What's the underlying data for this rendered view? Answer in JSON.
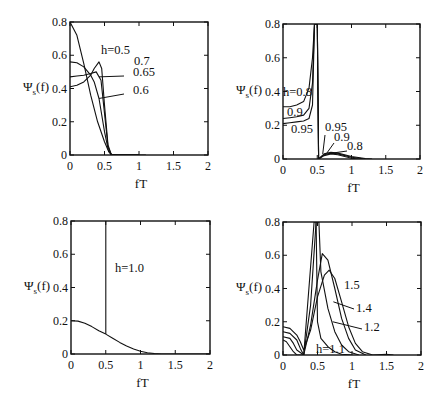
{
  "chart_data": [
    {
      "type": "line",
      "panel": "top-left",
      "title": "",
      "xlabel": "fT",
      "ylabel": "Ψs(f)",
      "xlim": [
        0,
        2
      ],
      "ylim": [
        0,
        0.8
      ],
      "xticks": [
        "0",
        "0.5",
        "1",
        "1.5",
        "2"
      ],
      "yticks": [
        "0",
        "0.2",
        "0.4",
        "0.6",
        "0.8"
      ],
      "grid": false,
      "legend": "inline annotations",
      "series": [
        {
          "name": "h=0.5",
          "x": [
            0,
            0.1,
            0.2,
            0.3,
            0.4,
            0.5,
            0.55,
            0.6,
            0.7,
            1.0
          ],
          "values": [
            0.8,
            0.72,
            0.55,
            0.36,
            0.2,
            0.08,
            0.03,
            0.005,
            0.0,
            0.0
          ]
        },
        {
          "name": "0.7",
          "x": [
            0,
            0.1,
            0.2,
            0.3,
            0.35,
            0.42,
            0.46,
            0.5,
            0.55,
            0.6,
            1.1
          ],
          "values": [
            0.41,
            0.42,
            0.44,
            0.48,
            0.52,
            0.56,
            0.52,
            0.3,
            0.06,
            0.0,
            0.0
          ]
        },
        {
          "name": "0.65",
          "x": [
            0,
            0.1,
            0.2,
            0.3,
            0.38,
            0.45,
            0.5,
            0.55,
            0.6,
            1.0
          ],
          "values": [
            0.47,
            0.475,
            0.48,
            0.49,
            0.5,
            0.45,
            0.25,
            0.05,
            0.0,
            0.0
          ]
        },
        {
          "name": "0.6",
          "x": [
            0,
            0.1,
            0.2,
            0.3,
            0.35,
            0.42,
            0.5,
            0.56,
            0.6,
            1.0
          ],
          "values": [
            0.56,
            0.555,
            0.53,
            0.48,
            0.44,
            0.34,
            0.14,
            0.02,
            0.0,
            0.0
          ]
        }
      ],
      "annotations": [
        "h=0.5",
        "0.7",
        "0.65",
        "0.6"
      ]
    },
    {
      "type": "line",
      "panel": "top-right",
      "title": "",
      "xlabel": "fT",
      "ylabel": "Ψs(f)",
      "xlim": [
        0,
        2
      ],
      "ylim": [
        0,
        0.8
      ],
      "xticks": [
        "0",
        "0.5",
        "1",
        "1.5",
        "2"
      ],
      "yticks": [
        "0",
        "0.2",
        "0.4",
        "0.6",
        "0.8"
      ],
      "grid": false,
      "legend": "inline annotations",
      "series": [
        {
          "name": "h=0.8",
          "x": [
            0,
            0.1,
            0.2,
            0.3,
            0.38,
            0.43,
            0.46,
            0.48,
            0.5,
            0.52,
            0.6,
            0.7,
            0.8,
            1.0,
            1.2,
            1.3
          ],
          "values": [
            0.31,
            0.31,
            0.32,
            0.34,
            0.42,
            0.6,
            0.8,
            0.8,
            0.8,
            0.0,
            0.03,
            0.04,
            0.035,
            0.015,
            0.003,
            0.0
          ]
        },
        {
          "name": "0.9",
          "x": [
            0,
            0.1,
            0.2,
            0.3,
            0.38,
            0.43,
            0.46,
            0.48,
            0.5,
            0.52,
            0.6,
            0.7,
            0.8,
            1.0,
            1.2
          ],
          "values": [
            0.24,
            0.245,
            0.25,
            0.26,
            0.3,
            0.45,
            0.8,
            0.8,
            0.8,
            0.0,
            0.025,
            0.035,
            0.03,
            0.01,
            0.0
          ]
        },
        {
          "name": "0.95",
          "x": [
            0,
            0.1,
            0.2,
            0.3,
            0.38,
            0.43,
            0.46,
            0.48,
            0.5,
            0.52,
            0.6,
            0.7,
            0.8,
            1.0,
            1.1
          ],
          "values": [
            0.21,
            0.215,
            0.22,
            0.225,
            0.24,
            0.32,
            0.8,
            0.8,
            0.8,
            0.0,
            0.02,
            0.03,
            0.025,
            0.005,
            0.0
          ]
        }
      ],
      "annotations": [
        "h=0.8",
        "0.9",
        "0.95",
        "0.95",
        "0.9",
        "0.8"
      ]
    },
    {
      "type": "line",
      "panel": "bottom-left",
      "title": "",
      "xlabel": "fT",
      "ylabel": "Ψs(f)",
      "xlim": [
        0,
        2
      ],
      "ylim": [
        0,
        0.8
      ],
      "xticks": [
        "0",
        "0.5",
        "1",
        "1.5",
        "2"
      ],
      "yticks": [
        "0",
        "0.2",
        "0.4",
        "0.6",
        "0.8"
      ],
      "grid": false,
      "legend": "inline annotations",
      "series": [
        {
          "name": "h=1.0",
          "x": [
            0,
            0.1,
            0.2,
            0.3,
            0.4,
            0.5,
            0.6,
            0.7,
            0.8,
            0.9,
            1.0,
            1.1,
            1.2,
            1.3,
            1.5,
            2.0
          ],
          "values": [
            0.2,
            0.198,
            0.185,
            0.165,
            0.14,
            0.12,
            0.095,
            0.07,
            0.048,
            0.03,
            0.017,
            0.008,
            0.003,
            0.0,
            0.0,
            0.0
          ]
        },
        {
          "name": "h=1.0 discrete line",
          "x": [
            0.5,
            0.5
          ],
          "values": [
            0.12,
            0.8
          ]
        }
      ],
      "annotations": [
        "h=1.0"
      ]
    },
    {
      "type": "line",
      "panel": "bottom-right",
      "title": "",
      "xlabel": "fT",
      "ylabel": "Ψs(f)",
      "xlim": [
        0,
        2
      ],
      "ylim": [
        0,
        0.8
      ],
      "xticks": [
        "0",
        "0.5",
        "1",
        "1.5",
        "2"
      ],
      "yticks": [
        "0",
        "0.2",
        "0.4",
        "0.6",
        "0.8"
      ],
      "grid": false,
      "legend": "inline annotations",
      "series": [
        {
          "name": "1.5",
          "x": [
            0,
            0.1,
            0.2,
            0.25,
            0.3,
            0.4,
            0.5,
            0.6,
            0.67,
            0.75,
            0.85,
            0.95,
            1.05,
            1.15,
            1.3,
            1.5,
            1.6
          ],
          "values": [
            0.17,
            0.16,
            0.12,
            0.08,
            0.03,
            0.15,
            0.35,
            0.48,
            0.51,
            0.46,
            0.32,
            0.17,
            0.07,
            0.02,
            0.0,
            0.005,
            0.0
          ]
        },
        {
          "name": "1.4",
          "x": [
            0,
            0.1,
            0.2,
            0.25,
            0.3,
            0.4,
            0.5,
            0.57,
            0.65,
            0.75,
            0.85,
            0.95,
            1.05,
            1.2
          ],
          "values": [
            0.14,
            0.13,
            0.09,
            0.04,
            0.0,
            0.18,
            0.45,
            0.61,
            0.57,
            0.4,
            0.22,
            0.1,
            0.03,
            0.0
          ]
        },
        {
          "name": "1.2",
          "x": [
            0,
            0.1,
            0.15,
            0.2,
            0.3,
            0.4,
            0.48,
            0.52,
            0.55,
            0.65,
            0.75,
            0.85,
            0.95,
            1.1
          ],
          "values": [
            0.11,
            0.1,
            0.07,
            0.03,
            0.0,
            0.3,
            0.8,
            0.8,
            0.5,
            0.28,
            0.14,
            0.06,
            0.02,
            0.0
          ]
        },
        {
          "name": "h=1.1",
          "x": [
            0,
            0.05,
            0.1,
            0.15,
            0.2,
            0.3,
            0.45,
            0.48,
            0.5,
            0.55,
            0.65,
            0.75,
            0.85,
            1.0
          ],
          "values": [
            0.09,
            0.08,
            0.05,
            0.02,
            0.0,
            0.0,
            0.8,
            0.8,
            0.2,
            0.1,
            0.05,
            0.02,
            0.005,
            0.0
          ]
        }
      ],
      "annotations": [
        "1.5",
        "1.4",
        "1.2",
        "h=1.1"
      ]
    }
  ],
  "labels": {
    "xlabel": "fT",
    "ylabel_main": "Ψ",
    "ylabel_sub": "s",
    "ylabel_tail": "(f)"
  }
}
